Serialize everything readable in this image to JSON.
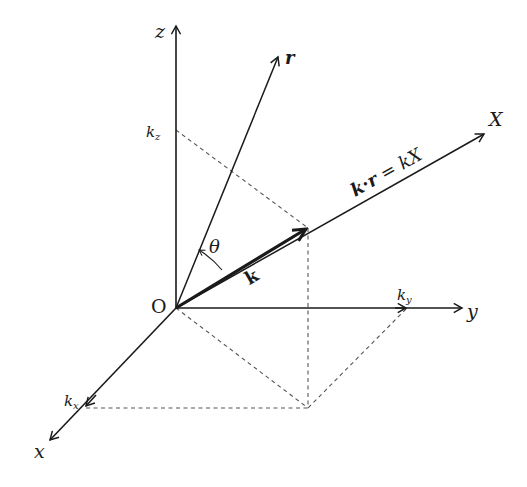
{
  "figure": {
    "origin_label": "O",
    "axes": {
      "z_label": "z",
      "y_label": "y",
      "x_label": "x",
      "X_label": "X"
    },
    "vectors": {
      "r_label": "r",
      "k_label": "k",
      "angle_label": "θ"
    },
    "components": {
      "kz_base": "k",
      "kz_sub": "z",
      "ky_base": "k",
      "ky_sub": "y",
      "kx_base": "k",
      "kx_sub": "x"
    },
    "equation": {
      "k": "k",
      "dot": "·",
      "r": "r",
      "eq": " = ",
      "rhs": "kX"
    },
    "colors": {
      "line": "#1a1a1a",
      "dashed": "#555555",
      "background": "#ffffff"
    }
  }
}
